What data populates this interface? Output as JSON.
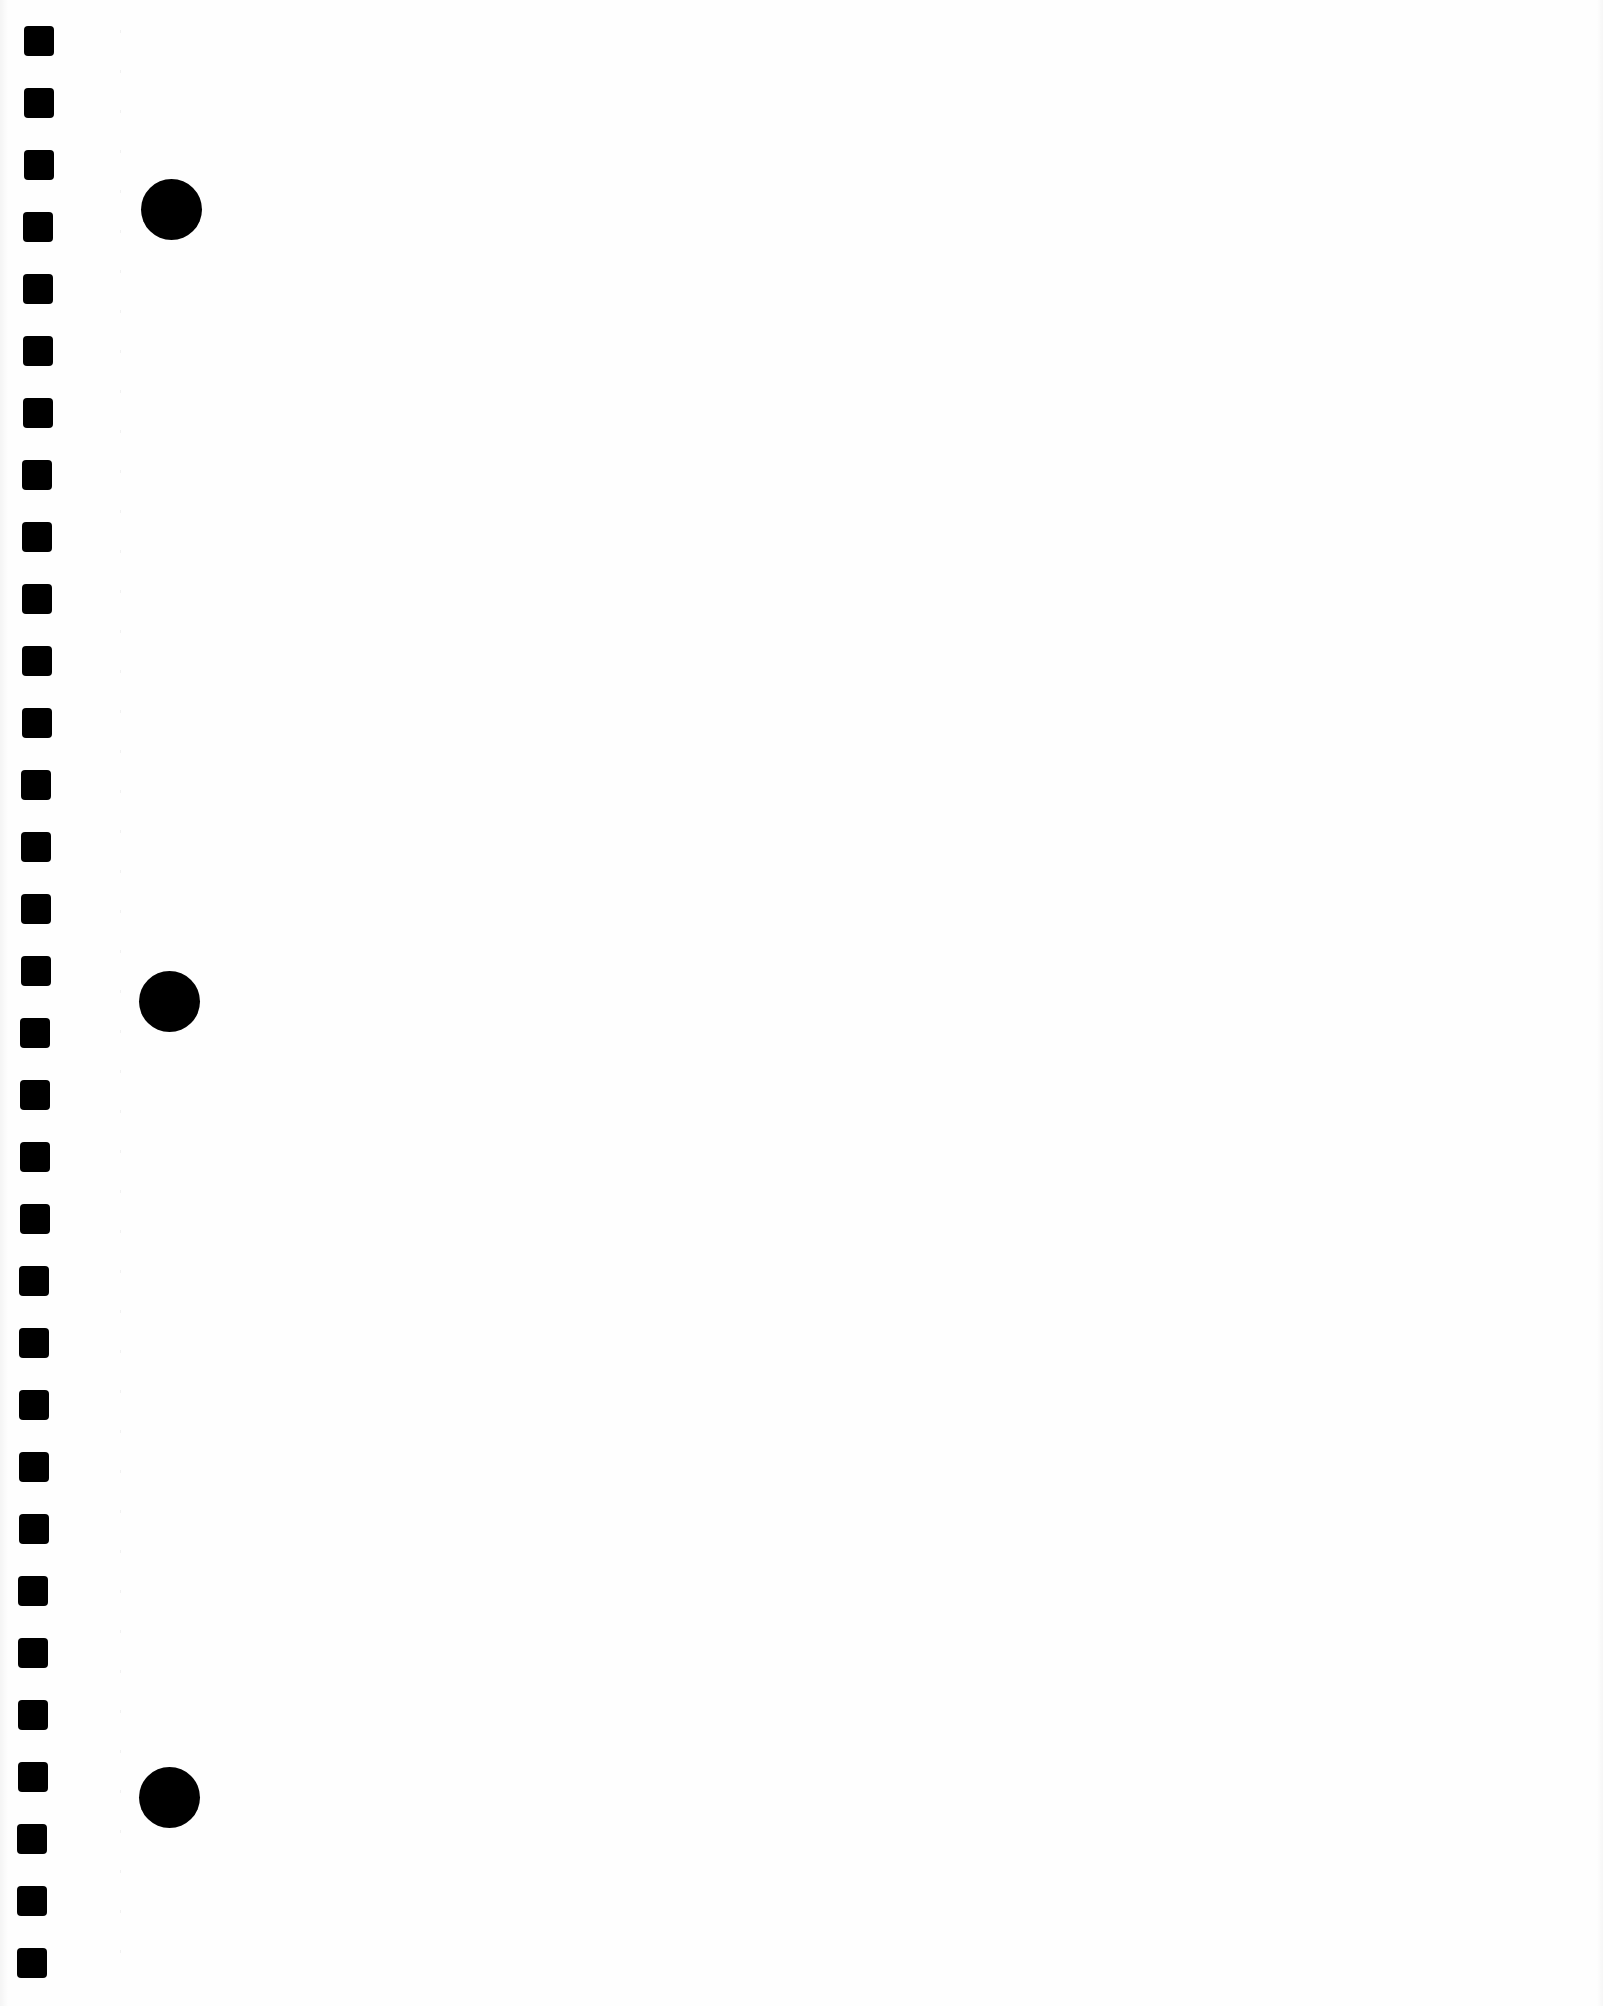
{
  "document": {
    "type": "blank notebook paper",
    "background_color": "#fefefe",
    "mark_color": "#000000"
  },
  "perforations": {
    "count": 32,
    "shape": "rounded-square",
    "size_px": 30,
    "first_center_y": 41,
    "step_y": 62,
    "x_top": 24,
    "x_bottom": 17
  },
  "binder_holes": {
    "count": 3,
    "diameter_px": 61,
    "centers": [
      {
        "x": 171,
        "y": 209
      },
      {
        "x": 169,
        "y": 1001
      },
      {
        "x": 169,
        "y": 1797
      }
    ]
  }
}
